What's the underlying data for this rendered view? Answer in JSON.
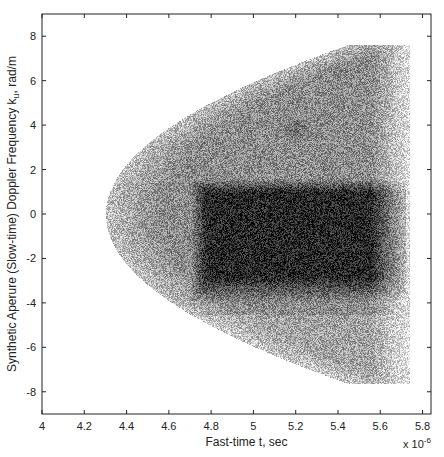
{
  "chart_data": {
    "type": "heatmap",
    "title": "",
    "xlabel": "Fast-time t, sec",
    "ylabel_parts": {
      "before": "Synthetic Aperure (Slow-time) Doppler Frequency k",
      "subscript": "u",
      "after": ", rad/m"
    },
    "ylabel": "Synthetic Aperure (Slow-time) Doppler Frequency k_u, rad/m",
    "x_exponent_label": "x 10",
    "x_exponent_power": "-6",
    "xlim": [
      4.0,
      5.84
    ],
    "ylim": [
      -9,
      9
    ],
    "x_ticks": [
      4,
      4.2,
      4.4,
      4.6,
      4.8,
      5,
      5.2,
      5.4,
      5.6,
      5.8
    ],
    "x_tick_labels": [
      "4",
      "4.2",
      "4.4",
      "4.6",
      "4.8",
      "5",
      "5.2",
      "5.4",
      "5.6",
      "5.8"
    ],
    "y_ticks": [
      8,
      6,
      4,
      2,
      0,
      -2,
      -4,
      -6,
      -8
    ],
    "y_tick_labels": [
      "8",
      "6",
      "4",
      "2",
      "0",
      "-2",
      "-4",
      "-6",
      "-8"
    ],
    "grid": false,
    "colormap": "gray (dark = high magnitude)",
    "support_region": {
      "shape": "parabola opening toward +t, truncated on the right",
      "vertex": {
        "t": 4.3,
        "ku": 0
      },
      "max_extent_ku": 7.6,
      "max_extent_at_t": 5.44,
      "right_edge_t": 5.74
    },
    "intensity_features": [
      {
        "name": "main dark band",
        "t_range": [
          4.7,
          5.72
        ],
        "ku_range": [
          -4.0,
          1.6
        ],
        "level": 0.85
      },
      {
        "name": "dark spot",
        "t": 5.2,
        "ku": 3.8,
        "level": 0.6
      },
      {
        "name": "background inside region",
        "level": 0.45
      },
      {
        "name": "fading toward right edge",
        "t_range": [
          5.55,
          5.74
        ],
        "level": 0.15
      }
    ]
  }
}
